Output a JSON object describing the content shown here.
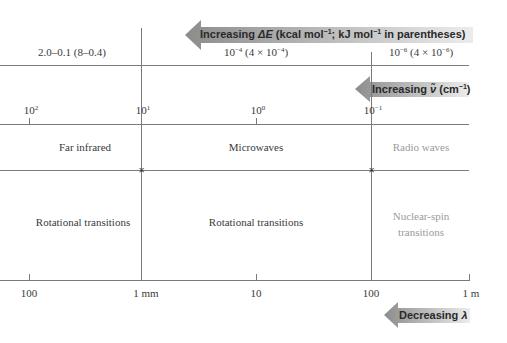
{
  "arrows": {
    "energy": {
      "label_prefix": "Increasing ",
      "symbol": "ΔE",
      "label_suffix": " (kcal mol",
      "unit_exp": "−1",
      "label_mid": "; kJ mol",
      "unit_exp2": "−1",
      "label_end": " in parentheses)",
      "direction": "left"
    },
    "wavenumber": {
      "label_prefix": "Increasing ",
      "symbol": "ν̃",
      "label_suffix": " (cm",
      "unit_exp": "−1",
      "label_end": ")",
      "direction": "left"
    },
    "wavelength": {
      "label_prefix": "Decreasing ",
      "symbol": "λ",
      "direction": "left"
    }
  },
  "energy_row": {
    "cells": [
      {
        "text": "2.0–0.1 (8–0.4)"
      },
      {
        "base": "10",
        "exp": "−4",
        "paren_pre": " (4 × 10",
        "paren_exp": "−4",
        "paren_post": ")"
      },
      {
        "base": "10",
        "exp": "−6",
        "paren_pre": " (4 × 10",
        "paren_exp": "−6",
        "paren_post": ")"
      }
    ]
  },
  "wavenumber_axis": {
    "ticks": [
      {
        "base": "10",
        "exp": "2"
      },
      {
        "base": "10",
        "exp": "1"
      },
      {
        "base": "10",
        "exp": "0"
      },
      {
        "base": "10",
        "exp": "−1"
      }
    ]
  },
  "regions": [
    {
      "name": "Far infrared",
      "transition": "Rotational transitions",
      "muted": false
    },
    {
      "name": "Microwaves",
      "transition": "Rotational transitions",
      "muted": false
    },
    {
      "name": "Radio waves",
      "transition_line1": "Nuclear-spin",
      "transition_line2": "transitions",
      "muted": true
    }
  ],
  "wavelength_axis": {
    "ticks": [
      "100",
      "1 mm",
      "10",
      "100",
      "1 m"
    ]
  },
  "colors": {
    "line": "#7a7a7a",
    "text": "#3a3a3a",
    "muted_text": "#9a9a9a",
    "arrow_dark": "#8c8c8c",
    "arrow_light": "#e6e6e6"
  }
}
